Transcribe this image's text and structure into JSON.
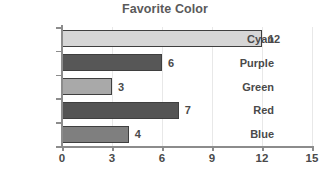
{
  "chart_data": {
    "type": "bar",
    "orientation": "horizontal",
    "title": "Favorite Color",
    "xlabel": "",
    "ylabel": "",
    "categories": [
      "Cyan",
      "Purple",
      "Green",
      "Red",
      "Blue"
    ],
    "values": [
      12,
      6,
      3,
      7,
      4
    ],
    "value_labels": [
      "12",
      "6",
      "3",
      "7",
      "4"
    ],
    "xlim": [
      0,
      15
    ],
    "xticks": [
      0,
      3,
      6,
      9,
      12,
      15
    ],
    "xtick_labels": [
      "0",
      "3",
      "6",
      "9",
      "12",
      "15"
    ],
    "grid": true,
    "legend": false,
    "bar_colors": [
      "#d6d6d6",
      "#575757",
      "#a9a9a9",
      "#545454",
      "#7f7f7f"
    ],
    "bar_edge_color": "#3f3f3f",
    "axis_color": "#8c8c8c",
    "grid_color": "#e8e8e8",
    "title_color": "#5a5a5a",
    "text_color": "#4a4a4a",
    "background": "#ffffff"
  }
}
